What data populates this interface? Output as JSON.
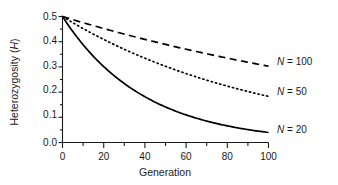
{
  "chart_data": {
    "type": "line",
    "title": "",
    "xlabel": "Generation",
    "ylabel": "Heterozygosity (H)",
    "ylabel_plain": "Heterozygosity",
    "ylabel_symbol": "H",
    "xlim": [
      0,
      100
    ],
    "ylim": [
      0.0,
      0.5
    ],
    "grid": false,
    "legend_position": "right-of-curve-ends",
    "x_ticks": [
      0,
      20,
      40,
      60,
      80,
      100
    ],
    "x_tick_labels": [
      "0",
      "20",
      "40",
      "60",
      "80",
      "100"
    ],
    "x_minor_tick_interval": 10,
    "y_ticks": [
      0.0,
      0.1,
      0.2,
      0.3,
      0.4,
      0.5
    ],
    "y_tick_labels": [
      "0.0",
      "0.1",
      "0.2",
      "0.3",
      "0.4",
      "0.5"
    ],
    "y_minor_tick_interval": 0.05,
    "x": [
      0,
      5,
      10,
      15,
      20,
      25,
      30,
      35,
      40,
      45,
      50,
      55,
      60,
      65,
      70,
      75,
      80,
      85,
      90,
      95,
      100
    ],
    "series": [
      {
        "name": "N = 20",
        "label_prefix": "N",
        "label_value": "= 20",
        "style": "solid",
        "color": "#000000",
        "N": 20,
        "formula": "H = 0.5 * (1 - 1/(2N))^t",
        "values": [
          0.5,
          0.44,
          0.389,
          0.344,
          0.304,
          0.269,
          0.238,
          0.21,
          0.186,
          0.164,
          0.145,
          0.128,
          0.113,
          0.1,
          0.089,
          0.078,
          0.069,
          0.061,
          0.054,
          0.048,
          0.042
        ]
      },
      {
        "name": "N = 50",
        "label_prefix": "N",
        "label_value": "= 50",
        "style": "dotted",
        "color": "#000000",
        "N": 50,
        "formula": "H = 0.5 * (1 - 1/(2N))^t",
        "values": [
          0.5,
          0.475,
          0.452,
          0.43,
          0.409,
          0.389,
          0.37,
          0.352,
          0.335,
          0.318,
          0.303,
          0.288,
          0.274,
          0.261,
          0.248,
          0.236,
          0.224,
          0.213,
          0.203,
          0.193,
          0.184
        ]
      },
      {
        "name": "N = 100",
        "label_prefix": "N",
        "label_value": "= 100",
        "style": "dashed",
        "color": "#000000",
        "N": 100,
        "formula": "H = 0.5 * (1 - 1/(2N))^t",
        "values": [
          0.5,
          0.488,
          0.476,
          0.464,
          0.452,
          0.441,
          0.43,
          0.42,
          0.409,
          0.399,
          0.389,
          0.38,
          0.37,
          0.361,
          0.352,
          0.344,
          0.335,
          0.327,
          0.319,
          0.311,
          0.303
        ]
      }
    ],
    "annotations": [
      {
        "text": "N = 100",
        "series": "N = 100"
      },
      {
        "text": "N = 50",
        "series": "N = 50"
      },
      {
        "text": "N = 20",
        "series": "N = 20"
      }
    ]
  }
}
